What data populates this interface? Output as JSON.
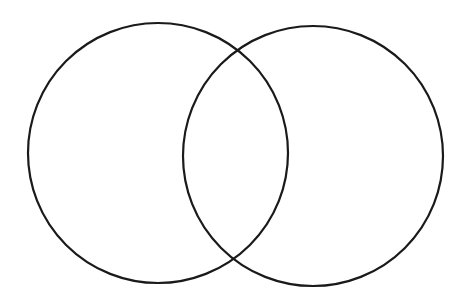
{
  "diagram": {
    "type": "venn",
    "background": "#ffffff",
    "stroke_color": "#1a1a1a",
    "stroke_width": 2.2,
    "circles": [
      {
        "id": "left",
        "cx": 158,
        "cy": 153,
        "r": 130,
        "label": ""
      },
      {
        "id": "right",
        "cx": 313,
        "cy": 156,
        "r": 130,
        "label": ""
      }
    ]
  }
}
